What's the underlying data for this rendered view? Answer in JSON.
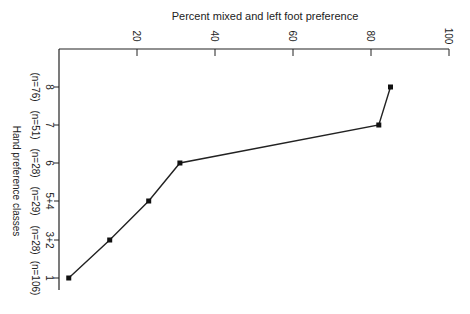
{
  "chart_data": {
    "type": "line",
    "orientation": "rotated-90",
    "title": "",
    "xlabel": "Hand preference classes",
    "ylabel": "Percent mixed and left foot preference",
    "ylim": [
      0,
      100
    ],
    "yticks": [
      20,
      40,
      60,
      80,
      100
    ],
    "categories": [
      "8",
      "7",
      "6",
      "5+4",
      "3+2",
      "1"
    ],
    "sample_sizes": [
      "(n=76)",
      "(n=51)",
      "(n=28)",
      "(n=29)",
      "(n=28)",
      "(n=106)"
    ],
    "values": [
      85,
      82,
      31,
      23,
      13,
      2.5
    ],
    "grid": false,
    "legend": null,
    "marker": "square"
  },
  "labels": {
    "value_axis_title": "Percent mixed and left foot preference",
    "category_axis_title": "Hand preference classes"
  }
}
